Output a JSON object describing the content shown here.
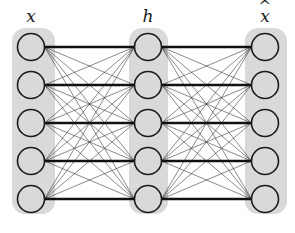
{
  "figure": {
    "type": "neural-network-diagram",
    "subtype": "autoencoder",
    "background_color": "#ffffff",
    "width": 295,
    "height": 233
  },
  "style": {
    "panel_fill": "#d9d9d9",
    "panel_radius": 13,
    "node_fill": "#d9d9d9",
    "node_stroke": "#1a1a1a",
    "node_stroke_width": 1.6,
    "node_radius": 13.5,
    "edge_color": "#2b2b2b",
    "edge_width": 0.55,
    "highlight_edge_color": "#111111",
    "highlight_edge_width": 2.6,
    "label_color": "#1a1a1a"
  },
  "layers": [
    {
      "id": "input",
      "label": "x",
      "label_has_hat": false,
      "label_x": 31,
      "label_y": 8,
      "node_count": 5,
      "node_cx": 31,
      "node_cys": [
        47,
        85,
        123,
        161,
        199
      ],
      "panel": {
        "x": 12,
        "y": 28,
        "width": 43,
        "height": 186
      }
    },
    {
      "id": "hidden",
      "label": "h",
      "label_has_hat": false,
      "label_x": 148,
      "label_y": 8,
      "node_count": 5,
      "node_cx": 148,
      "node_cys": [
        47,
        85,
        123,
        161,
        199
      ],
      "panel": {
        "x": 129,
        "y": 28,
        "width": 39,
        "height": 186
      }
    },
    {
      "id": "output",
      "label": "x",
      "label_has_hat": true,
      "hat_glyph": "^",
      "label_x": 265,
      "label_y": 8,
      "node_count": 5,
      "node_cx": 265,
      "node_cys": [
        47,
        85,
        123,
        161,
        199
      ],
      "panel": {
        "x": 245,
        "y": 28,
        "width": 42,
        "height": 186
      }
    }
  ],
  "connections": [
    {
      "id": "input-to-hidden",
      "from_layer": "input",
      "to_layer": "hidden",
      "fully_connected": true,
      "highlighted_pairs": [
        [
          0,
          0
        ],
        [
          1,
          1
        ],
        [
          2,
          2
        ],
        [
          3,
          3
        ],
        [
          4,
          4
        ]
      ]
    },
    {
      "id": "hidden-to-output",
      "from_layer": "hidden",
      "to_layer": "output",
      "fully_connected": true,
      "highlighted_pairs": [
        [
          0,
          0
        ],
        [
          1,
          1
        ],
        [
          2,
          2
        ],
        [
          3,
          3
        ],
        [
          4,
          4
        ]
      ]
    }
  ]
}
